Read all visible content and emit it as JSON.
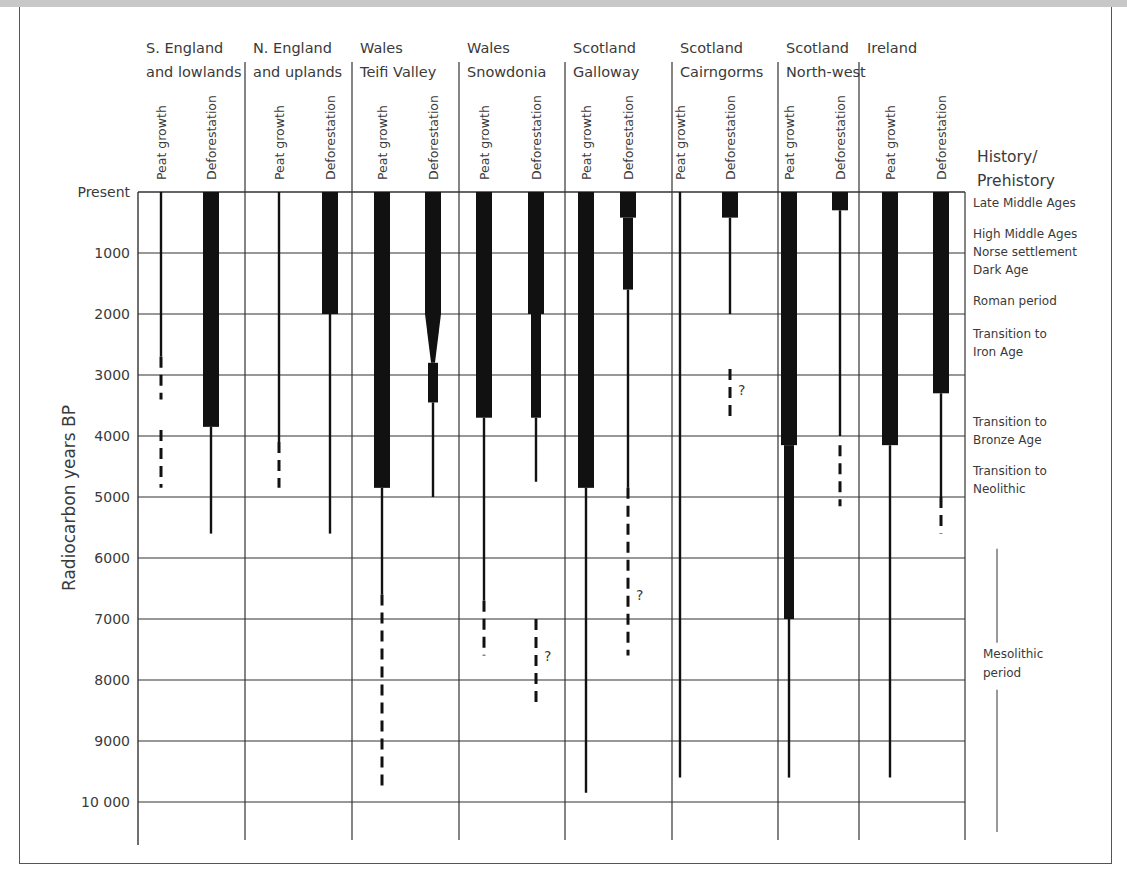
{
  "chart_data": {
    "type": "range-bar",
    "title": "",
    "ylabel": "Radiocarbon years BP",
    "ylim": [
      0,
      10000
    ],
    "y_ticks": [
      "Present",
      "1000",
      "2000",
      "3000",
      "4000",
      "5000",
      "6000",
      "7000",
      "8000",
      "9000",
      "10 000"
    ],
    "column_labels": [
      "Peat growth",
      "Deforestation"
    ],
    "regions": [
      {
        "name_line1": "S. England",
        "name_line2": "and lowlands",
        "peat_growth": {
          "solid": [
            [
              0,
              2700
            ]
          ],
          "dashed": [
            [
              2700,
              3400
            ],
            [
              3900,
              4850
            ]
          ]
        },
        "deforestation": {
          "thick": [
            [
              0,
              3850
            ]
          ],
          "thin": [
            [
              3850,
              5600
            ]
          ]
        }
      },
      {
        "name_line1": "N. England",
        "name_line2": "and uplands",
        "peat_growth": {
          "solid": [
            [
              0,
              4100
            ]
          ],
          "dashed": [
            [
              4100,
              4850
            ]
          ]
        },
        "deforestation": {
          "thick": [
            [
              0,
              2000
            ]
          ],
          "thin": [
            [
              2000,
              5600
            ]
          ]
        }
      },
      {
        "name_line1": "Wales",
        "name_line2": "Teifi Valley",
        "peat_growth": {
          "thick": [
            [
              0,
              4850
            ]
          ],
          "solid": [
            [
              4850,
              6600
            ]
          ],
          "dashed": [
            [
              6600,
              9800
            ]
          ]
        },
        "deforestation": {
          "thick": [
            [
              0,
              2000
            ]
          ],
          "tapering": [
            [
              2000,
              2800
            ]
          ],
          "medium": [
            [
              2800,
              3450
            ]
          ],
          "thin": [
            [
              3450,
              5000
            ]
          ]
        }
      },
      {
        "name_line1": "Wales",
        "name_line2": "Snowdonia",
        "peat_growth": {
          "thick": [
            [
              0,
              3700
            ]
          ],
          "solid": [
            [
              3700,
              6700
            ]
          ],
          "dashed": [
            [
              6700,
              7600
            ]
          ]
        },
        "deforestation": {
          "thick": [
            [
              0,
              2000
            ]
          ],
          "medium": [
            [
              2000,
              3700
            ]
          ],
          "thin": [
            [
              3700,
              4750
            ]
          ],
          "dashed_uncertain": [
            [
              7000,
              8450
            ]
          ],
          "question_mark_at": 7600
        }
      },
      {
        "name_line1": "Scotland",
        "name_line2": "Galloway",
        "peat_growth": {
          "thick": [
            [
              0,
              4850
            ]
          ],
          "solid": [
            [
              4850,
              9850
            ]
          ]
        },
        "deforestation": {
          "thick": [
            [
              0,
              420
            ]
          ],
          "medium": [
            [
              420,
              1600
            ]
          ],
          "thin": [
            [
              1600,
              4850
            ]
          ],
          "dashed_uncertain": [
            [
              4850,
              7600
            ]
          ],
          "question_mark_at": 6600
        }
      },
      {
        "name_line1": "Scotland",
        "name_line2": "Cairngorms",
        "peat_growth": {
          "solid": [
            [
              0,
              9600
            ]
          ]
        },
        "deforestation": {
          "thick": [
            [
              0,
              420
            ]
          ],
          "thin": [
            [
              420,
              2000
            ]
          ],
          "dashed_uncertain": [
            [
              2900,
              3750
            ]
          ],
          "question_mark_at": 3250
        }
      },
      {
        "name_line1": "Scotland",
        "name_line2": "North-west",
        "peat_growth": {
          "thick": [
            [
              0,
              4150
            ]
          ],
          "medium": [
            [
              4150,
              7000
            ]
          ],
          "solid": [
            [
              7000,
              9600
            ]
          ]
        },
        "deforestation": {
          "thick": [
            [
              0,
              300
            ]
          ],
          "thin": [
            [
              300,
              4000
            ]
          ],
          "dashed": [
            [
              4150,
              5150
            ]
          ]
        }
      },
      {
        "name_line1": "Ireland",
        "name_line2": "",
        "peat_growth": {
          "thick": [
            [
              0,
              4150
            ]
          ],
          "solid": [
            [
              4150,
              9600
            ]
          ]
        },
        "deforestation": {
          "thick": [
            [
              0,
              3300
            ]
          ],
          "thin": [
            [
              3300,
              5000
            ]
          ],
          "dashed": [
            [
              5000,
              5600
            ]
          ]
        }
      }
    ],
    "history_header_line1": "History/",
    "history_header_line2": "Prehistory",
    "history_periods": [
      {
        "label": "Late Middle Ages",
        "y_value": 400
      },
      {
        "label": "High Middle Ages",
        "y_value": 800
      },
      {
        "label": "Norse settlement",
        "y_value": 1100
      },
      {
        "label": "Dark Age",
        "y_value": 1400
      },
      {
        "label": "Roman period",
        "y_value": 1900
      },
      {
        "label_line1": "Transition to",
        "label_line2": "Iron Age",
        "y_value": 2550
      },
      {
        "label_line1": "Transition to",
        "label_line2": "Bronze Age",
        "y_value": 4000
      },
      {
        "label_line1": "Transition to",
        "label_line2": "Neolithic",
        "y_value": 4800
      },
      {
        "label_line1": "Mesolithic",
        "label_line2": "period",
        "y_value": 7800,
        "span": [
          5700,
          10000
        ]
      }
    ],
    "grid": true,
    "legend": "none"
  }
}
